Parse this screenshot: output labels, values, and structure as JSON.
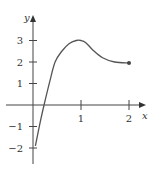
{
  "chart_data": {
    "type": "line",
    "title": "",
    "xlabel": "x",
    "ylabel": "y",
    "xlim": [
      -0.6,
      2.4
    ],
    "ylim": [
      -2.8,
      3.6
    ],
    "grid": false,
    "x_ticks": [
      {
        "value": 1,
        "label": "1"
      },
      {
        "value": 2,
        "label": "2"
      }
    ],
    "y_ticks": [
      {
        "value": 3,
        "label": "3"
      },
      {
        "value": 2,
        "label": "2"
      },
      {
        "value": 1,
        "label": "1"
      },
      {
        "value": -1,
        "label": "−1"
      },
      {
        "value": -2,
        "label": "−2"
      }
    ],
    "series": [
      {
        "name": "f(x)",
        "x": [
          0.05,
          0.15,
          0.23,
          0.35,
          0.46,
          0.6,
          0.75,
          0.9,
          1.0,
          1.1,
          1.25,
          1.45,
          1.7,
          2.0
        ],
        "y": [
          -1.9,
          -0.8,
          0.0,
          1.1,
          2.0,
          2.5,
          2.85,
          3.0,
          3.0,
          2.9,
          2.55,
          2.2,
          2.0,
          1.95
        ]
      }
    ],
    "endpoint": {
      "x": 2.0,
      "y": 1.95,
      "marker": "filled-dot"
    },
    "colors": {
      "curve": "#555555",
      "axes": "#444444",
      "text": "#333333"
    }
  }
}
